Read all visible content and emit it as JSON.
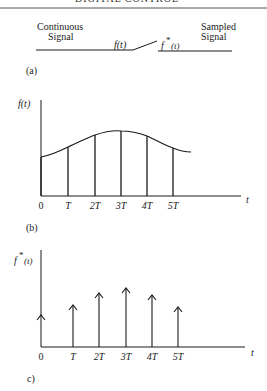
{
  "header": {
    "title": "DIGITAL CONTROL"
  },
  "panel_a": {
    "label": "(a)",
    "continuous_label_1": "Continuous",
    "continuous_label_2": "Signal",
    "sampled_label_1": "Sampled",
    "sampled_label_2": "Signal",
    "input_symbol": "f(t)",
    "output_symbol_f": "f",
    "output_symbol_star": "*",
    "output_symbol_t": "(t)"
  },
  "panel_b": {
    "label": "(b)",
    "y_axis_label": "f(t)",
    "x_axis_label": "t",
    "ticks": [
      "0",
      "T",
      "2T",
      "3T",
      "4T",
      "5T"
    ]
  },
  "panel_c": {
    "label": "c)",
    "y_axis_f": "f",
    "y_axis_star": "*",
    "y_axis_t": "(t)",
    "x_axis_label": "t",
    "ticks": [
      "0",
      "T",
      "2T",
      "3T",
      "4T",
      "5T"
    ]
  },
  "colors": {
    "ink": "#1a1a1a",
    "background": "#ffffff"
  }
}
